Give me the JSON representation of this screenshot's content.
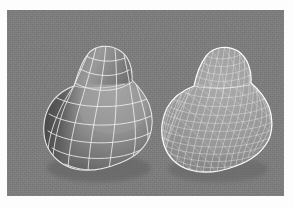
{
  "figure": {
    "domain": "paper-figure",
    "caption": "",
    "background_color": "#7d7d7d",
    "page_color": "#fdfdfd",
    "panel": {
      "x": 7,
      "y": 10,
      "width": 277,
      "height": 186
    },
    "objects": [
      {
        "id": "left-object",
        "name": "coarse-wireframe-surface",
        "description": "Shaded 3D free-form surface overlaid with a coarse curvilinear quadrilateral control-patch wireframe",
        "mesh_type": "coarse-quad-wireframe",
        "approx_u_lines": 7,
        "approx_v_lines": 7,
        "bounds": {
          "x": 33,
          "y": 40,
          "width": 112,
          "height": 126
        },
        "surface_light_color": "#9a9a9a",
        "surface_dark_color": "#454545",
        "wire_color": "#f2f2f2",
        "label": ""
      },
      {
        "id": "right-object",
        "name": "dense-triangulated-mesh",
        "description": "Same free-form shape rendered as a dense triangulated wireframe mesh",
        "mesh_type": "fine-triangular-mesh",
        "approx_u_lines": 28,
        "approx_v_lines": 26,
        "bounds": {
          "x": 158,
          "y": 42,
          "width": 104,
          "height": 126
        },
        "surface_light_color": "#b9b9b9",
        "surface_dark_color": "#8a8a8a",
        "wire_color": "#fbfbfb",
        "label": ""
      }
    ],
    "annotations": []
  },
  "chart_data": {
    "type": "table",
    "title": "",
    "categories": [
      "coarse wireframe surface",
      "dense triangulated mesh"
    ],
    "values": [
      49,
      728
    ]
  }
}
